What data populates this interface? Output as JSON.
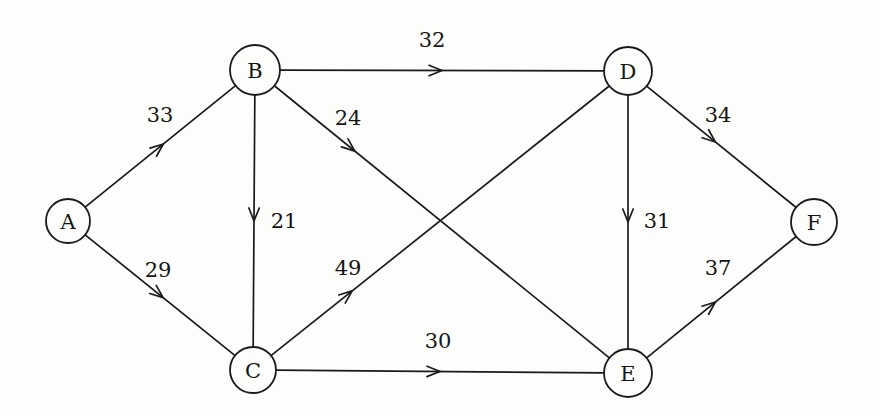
{
  "figure": {
    "background_color": "#fdfdfb",
    "stroke_color": "#1a1a1a",
    "text_color": "#141414"
  },
  "chart_data": {
    "type": "diagram",
    "graph_kind": "directed weighted graph",
    "title": "",
    "directed": true,
    "node_count": 6,
    "edge_count": 10,
    "nodes": [
      {
        "id": "A",
        "label": "A",
        "x": 68,
        "y": 221,
        "r": 22
      },
      {
        "id": "B",
        "label": "B",
        "x": 255,
        "y": 70,
        "r": 25
      },
      {
        "id": "C",
        "label": "C",
        "x": 253,
        "y": 370,
        "r": 23
      },
      {
        "id": "D",
        "label": "D",
        "x": 628,
        "y": 71,
        "r": 24
      },
      {
        "id": "E",
        "label": "E",
        "x": 628,
        "y": 373,
        "r": 24
      },
      {
        "id": "F",
        "label": "F",
        "x": 814,
        "y": 222,
        "r": 23
      }
    ],
    "edges": [
      {
        "from": "A",
        "to": "B",
        "weight": 33,
        "label": "33",
        "label_x": 160,
        "label_y": 115,
        "arrow_t": 0.52
      },
      {
        "from": "A",
        "to": "C",
        "weight": 29,
        "label": "29",
        "label_x": 158,
        "label_y": 270,
        "arrow_t": 0.52
      },
      {
        "from": "B",
        "to": "D",
        "weight": 32,
        "label": "32",
        "label_x": 432,
        "label_y": 40,
        "arrow_t": 0.5
      },
      {
        "from": "B",
        "to": "C",
        "weight": 21,
        "label": "21",
        "label_x": 284,
        "label_y": 221,
        "arrow_t": 0.5
      },
      {
        "from": "B",
        "to": "E",
        "weight": 24,
        "label": "24",
        "label_x": 348,
        "label_y": 118,
        "arrow_t": 0.24
      },
      {
        "from": "C",
        "to": "D",
        "weight": 49,
        "label": "49",
        "label_x": 348,
        "label_y": 268,
        "arrow_t": 0.24
      },
      {
        "from": "C",
        "to": "E",
        "weight": 30,
        "label": "30",
        "label_x": 438,
        "label_y": 341,
        "arrow_t": 0.5
      },
      {
        "from": "D",
        "to": "F",
        "weight": 34,
        "label": "34",
        "label_x": 718,
        "label_y": 115,
        "arrow_t": 0.46
      },
      {
        "from": "D",
        "to": "E",
        "weight": 31,
        "label": "31",
        "label_x": 657,
        "label_y": 221,
        "arrow_t": 0.5
      },
      {
        "from": "E",
        "to": "F",
        "weight": 37,
        "label": "37",
        "label_x": 718,
        "label_y": 268,
        "arrow_t": 0.46
      }
    ],
    "weights": [
      33,
      29,
      32,
      21,
      24,
      49,
      30,
      34,
      31,
      37
    ],
    "node_labels": [
      "A",
      "B",
      "C",
      "D",
      "E",
      "F"
    ],
    "annotations": [],
    "legend": []
  }
}
